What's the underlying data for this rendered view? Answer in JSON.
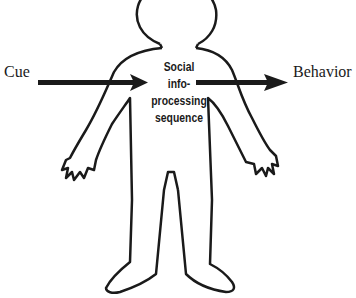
{
  "diagram": {
    "input_label": "Cue",
    "output_label": "Behavior",
    "center_lines": [
      "Social",
      "info-",
      "processing",
      "sequence"
    ],
    "colors": {
      "stroke": "#1a1a1a",
      "background": "#ffffff"
    }
  }
}
